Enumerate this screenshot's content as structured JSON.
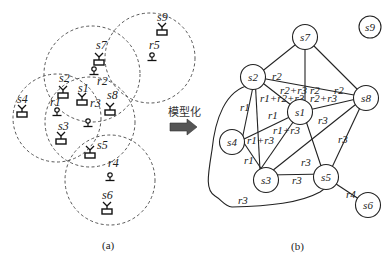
{
  "arrow_label": "模型化",
  "captions": {
    "a": "(a)",
    "b": "(b)"
  },
  "panel_a": {
    "sensors": [
      {
        "id": "s1",
        "label": "s1"
      },
      {
        "id": "s2",
        "label": "s2"
      },
      {
        "id": "s3",
        "label": "s3"
      },
      {
        "id": "s4",
        "label": "s4"
      },
      {
        "id": "s5",
        "label": "s5"
      },
      {
        "id": "s6",
        "label": "s6"
      },
      {
        "id": "s7",
        "label": "s7"
      },
      {
        "id": "s8",
        "label": "s8"
      },
      {
        "id": "s9",
        "label": "s9"
      }
    ],
    "relays": [
      {
        "id": "r1",
        "label": "r1"
      },
      {
        "id": "r2",
        "label": "r2"
      },
      {
        "id": "r3",
        "label": "r3"
      },
      {
        "id": "r4",
        "label": "r4"
      },
      {
        "id": "r5",
        "label": "r5"
      }
    ]
  },
  "panel_b": {
    "nodes": [
      {
        "id": "s1",
        "label": "s1"
      },
      {
        "id": "s2",
        "label": "s2"
      },
      {
        "id": "s3",
        "label": "s3"
      },
      {
        "id": "s4",
        "label": "s4"
      },
      {
        "id": "s5",
        "label": "s5"
      },
      {
        "id": "s6",
        "label": "s6"
      },
      {
        "id": "s7",
        "label": "s7"
      },
      {
        "id": "s8",
        "label": "s8"
      },
      {
        "id": "s9",
        "label": "s9"
      }
    ],
    "edges": [
      {
        "from": "s7",
        "to": "s2",
        "label": "r2"
      },
      {
        "from": "s7",
        "to": "s1",
        "label": "r2"
      },
      {
        "from": "s7",
        "to": "s8",
        "label": "r2"
      },
      {
        "from": "s2",
        "to": "s8",
        "label": "r2+r3"
      },
      {
        "from": "s2",
        "to": "s1",
        "label": "r1+r2+r3"
      },
      {
        "from": "s1",
        "to": "s8",
        "label": "r2+r3"
      },
      {
        "from": "s2",
        "to": "s4",
        "label": "r1"
      },
      {
        "from": "s2",
        "to": "s3",
        "label": "r1"
      },
      {
        "from": "s4",
        "to": "s1",
        "label": "r1"
      },
      {
        "from": "s3",
        "to": "s1",
        "label": "r1+r3"
      },
      {
        "from": "s4",
        "to": "s3",
        "label": "r1"
      },
      {
        "from": "s8",
        "to": "s3",
        "label": "r3"
      },
      {
        "from": "s1",
        "to": "s5",
        "label": "r3"
      },
      {
        "from": "s8",
        "to": "s5",
        "label": "r3"
      },
      {
        "from": "s3",
        "to": "s5",
        "label": "r3"
      },
      {
        "from": "s5",
        "to": "s6",
        "label": "r4"
      },
      {
        "from": "s2",
        "to": "s5",
        "label": "r3",
        "curved": true
      }
    ],
    "edge_labels": {
      "s7_s2": "r2",
      "s2s8_mid": "r2+r3",
      "s7_s1": "r2",
      "s7_s8": "r2",
      "s2_s1": "r1+r2+r3",
      "s1_s8": "r2+r3",
      "s2_s4": "r1",
      "s4_s1": "r1",
      "s3_s1": "r1+r3",
      "s4_s3_upper": "r1+r3",
      "s4_s3": "r1",
      "s8_s3": "r3",
      "s1_s5": "r3",
      "s8_s5": "r3",
      "s3_s5": "r3",
      "s5_s6": "r4",
      "curve": "r3"
    }
  }
}
